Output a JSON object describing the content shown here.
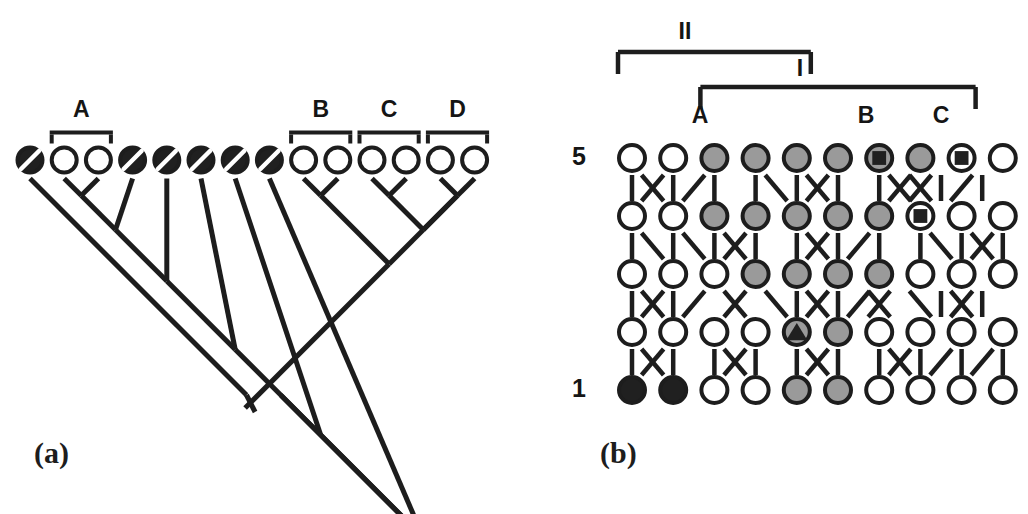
{
  "figure": {
    "panels": [
      {
        "id": "a",
        "label": "(a)",
        "label_x": 34,
        "label_y": 436
      },
      {
        "id": "b",
        "label": "(b)",
        "label_x": 600,
        "label_y": 436
      }
    ]
  },
  "panel_a": {
    "type": "cladogram",
    "tip_count": 14,
    "tip_start_x": 30,
    "tip_pitch": 34.2,
    "tip_y": 160,
    "tip_radius": 14.5,
    "tips": [
      {
        "index": 1,
        "fill": "black",
        "marker": "slash"
      },
      {
        "index": 2,
        "fill": "white",
        "marker": "none"
      },
      {
        "index": 3,
        "fill": "white",
        "marker": "none"
      },
      {
        "index": 4,
        "fill": "black",
        "marker": "slash"
      },
      {
        "index": 5,
        "fill": "black",
        "marker": "slash"
      },
      {
        "index": 6,
        "fill": "black",
        "marker": "slash"
      },
      {
        "index": 7,
        "fill": "black",
        "marker": "slash"
      },
      {
        "index": 8,
        "fill": "black",
        "marker": "slash"
      },
      {
        "index": 9,
        "fill": "white",
        "marker": "none"
      },
      {
        "index": 10,
        "fill": "white",
        "marker": "none"
      },
      {
        "index": 11,
        "fill": "white",
        "marker": "none"
      },
      {
        "index": 12,
        "fill": "white",
        "marker": "none"
      },
      {
        "index": 13,
        "fill": "white",
        "marker": "none"
      },
      {
        "index": 14,
        "fill": "white",
        "marker": "none"
      }
    ],
    "brackets": [
      {
        "label": "A",
        "from_tip": 2,
        "to_tip": 3,
        "label_y": 100
      },
      {
        "label": "B",
        "from_tip": 9,
        "to_tip": 10,
        "label_y": 100
      },
      {
        "label": "C",
        "from_tip": 11,
        "to_tip": 12,
        "label_y": 100
      },
      {
        "label": "D",
        "from_tip": 13,
        "to_tip": 14,
        "label_y": 100
      }
    ]
  },
  "panel_b": {
    "type": "haplotype-network-grid",
    "columns": 10,
    "rows": 5,
    "col_start_x": 632,
    "col_pitch": 41.2,
    "row_start_y": 158,
    "row_pitch": 58,
    "node_radius": 15,
    "row_labels": [
      {
        "label": "5",
        "row": 5,
        "x": 572,
        "y": 158
      },
      {
        "label": "1",
        "row": 1,
        "x": 572,
        "y": 390
      }
    ],
    "grid": [
      {
        "row": 5,
        "nodes": [
          {
            "col": 1,
            "fill": "white",
            "marker": "none"
          },
          {
            "col": 2,
            "fill": "white",
            "marker": "none"
          },
          {
            "col": 3,
            "fill": "gray",
            "marker": "none"
          },
          {
            "col": 4,
            "fill": "gray",
            "marker": "none"
          },
          {
            "col": 5,
            "fill": "gray",
            "marker": "none"
          },
          {
            "col": 6,
            "fill": "gray",
            "marker": "none"
          },
          {
            "col": 7,
            "fill": "gray",
            "marker": "square"
          },
          {
            "col": 8,
            "fill": "gray",
            "marker": "none"
          },
          {
            "col": 9,
            "fill": "white",
            "marker": "square"
          },
          {
            "col": 10,
            "fill": "white",
            "marker": "none"
          }
        ]
      },
      {
        "row": 4,
        "nodes": [
          {
            "col": 1,
            "fill": "white",
            "marker": "none"
          },
          {
            "col": 2,
            "fill": "white",
            "marker": "none"
          },
          {
            "col": 3,
            "fill": "gray",
            "marker": "none"
          },
          {
            "col": 4,
            "fill": "gray",
            "marker": "none"
          },
          {
            "col": 5,
            "fill": "gray",
            "marker": "none"
          },
          {
            "col": 6,
            "fill": "gray",
            "marker": "none"
          },
          {
            "col": 7,
            "fill": "gray",
            "marker": "none"
          },
          {
            "col": 8,
            "fill": "white",
            "marker": "square"
          },
          {
            "col": 9,
            "fill": "white",
            "marker": "none"
          },
          {
            "col": 10,
            "fill": "white",
            "marker": "none"
          }
        ]
      },
      {
        "row": 3,
        "nodes": [
          {
            "col": 1,
            "fill": "white",
            "marker": "none"
          },
          {
            "col": 2,
            "fill": "white",
            "marker": "none"
          },
          {
            "col": 3,
            "fill": "white",
            "marker": "none"
          },
          {
            "col": 4,
            "fill": "gray",
            "marker": "none"
          },
          {
            "col": 5,
            "fill": "gray",
            "marker": "none"
          },
          {
            "col": 6,
            "fill": "gray",
            "marker": "none"
          },
          {
            "col": 7,
            "fill": "gray",
            "marker": "none"
          },
          {
            "col": 8,
            "fill": "white",
            "marker": "none"
          },
          {
            "col": 9,
            "fill": "white",
            "marker": "none"
          },
          {
            "col": 10,
            "fill": "white",
            "marker": "none"
          }
        ]
      },
      {
        "row": 2,
        "nodes": [
          {
            "col": 1,
            "fill": "white",
            "marker": "none"
          },
          {
            "col": 2,
            "fill": "white",
            "marker": "none"
          },
          {
            "col": 3,
            "fill": "white",
            "marker": "none"
          },
          {
            "col": 4,
            "fill": "white",
            "marker": "none"
          },
          {
            "col": 5,
            "fill": "gray",
            "marker": "triangle"
          },
          {
            "col": 6,
            "fill": "gray",
            "marker": "none"
          },
          {
            "col": 7,
            "fill": "white",
            "marker": "none"
          },
          {
            "col": 8,
            "fill": "white",
            "marker": "none"
          },
          {
            "col": 9,
            "fill": "white",
            "marker": "none"
          },
          {
            "col": 10,
            "fill": "white",
            "marker": "none"
          }
        ]
      },
      {
        "row": 1,
        "nodes": [
          {
            "col": 1,
            "fill": "black",
            "marker": "none"
          },
          {
            "col": 2,
            "fill": "black",
            "marker": "none"
          },
          {
            "col": 3,
            "fill": "white",
            "marker": "none"
          },
          {
            "col": 4,
            "fill": "white",
            "marker": "none"
          },
          {
            "col": 5,
            "fill": "gray",
            "marker": "none"
          },
          {
            "col": 6,
            "fill": "gray",
            "marker": "none"
          },
          {
            "col": 7,
            "fill": "white",
            "marker": "none"
          },
          {
            "col": 8,
            "fill": "white",
            "marker": "none"
          },
          {
            "col": 9,
            "fill": "white",
            "marker": "none"
          },
          {
            "col": 10,
            "fill": "white",
            "marker": "none"
          }
        ]
      }
    ],
    "connector_rows": [
      {
        "between": "5-4",
        "y": 188,
        "glyphs": [
          "|",
          "X",
          "|",
          "/",
          "|",
          ".",
          "|",
          "\\",
          "|",
          "X",
          "|",
          ".",
          "|",
          "X",
          "X",
          "|",
          "/",
          "|"
        ]
      },
      {
        "between": "4-3",
        "y": 246,
        "glyphs": [
          "|",
          "\\",
          "|",
          "\\",
          "|",
          "X",
          "|",
          ".",
          "|",
          "X",
          "|",
          "/",
          "|",
          ".",
          "|",
          "\\",
          "|",
          "X",
          "|"
        ]
      },
      {
        "between": "3-2",
        "y": 304,
        "glyphs": [
          "|",
          "X",
          "|",
          "/",
          ".",
          "X",
          ".",
          "\\",
          "|",
          "X",
          "|",
          "/",
          "X",
          ".",
          "\\",
          "|",
          "X",
          "|"
        ]
      },
      {
        "between": "2-1",
        "y": 362,
        "glyphs": [
          "|",
          "X",
          "|",
          ".",
          "|",
          "X",
          "|",
          ".",
          "|",
          "X",
          "|",
          ".",
          "|",
          "X",
          "|",
          "/",
          "|",
          "/",
          "|"
        ]
      }
    ],
    "brackets": [
      {
        "label": "II",
        "from_col": 1,
        "to_col": 5,
        "bar_y": 52,
        "label_x": 685,
        "label_y": 18,
        "drop": 22
      },
      {
        "label": "I",
        "from_col": 3,
        "to_col": 9,
        "bar_y": 87,
        "label_x": 800,
        "label_y": 55,
        "drop": 22
      }
    ],
    "group_labels": [
      {
        "label": "A",
        "x": 700,
        "y": 102
      },
      {
        "label": "B",
        "x": 866,
        "y": 102
      },
      {
        "label": "C",
        "x": 941,
        "y": 102
      }
    ]
  },
  "colors": {
    "ink": "#1d1d1d",
    "white_fill": "#ffffff",
    "gray_fill": "#9a9a9a",
    "black_fill": "#202020",
    "background": "#ffffff"
  }
}
